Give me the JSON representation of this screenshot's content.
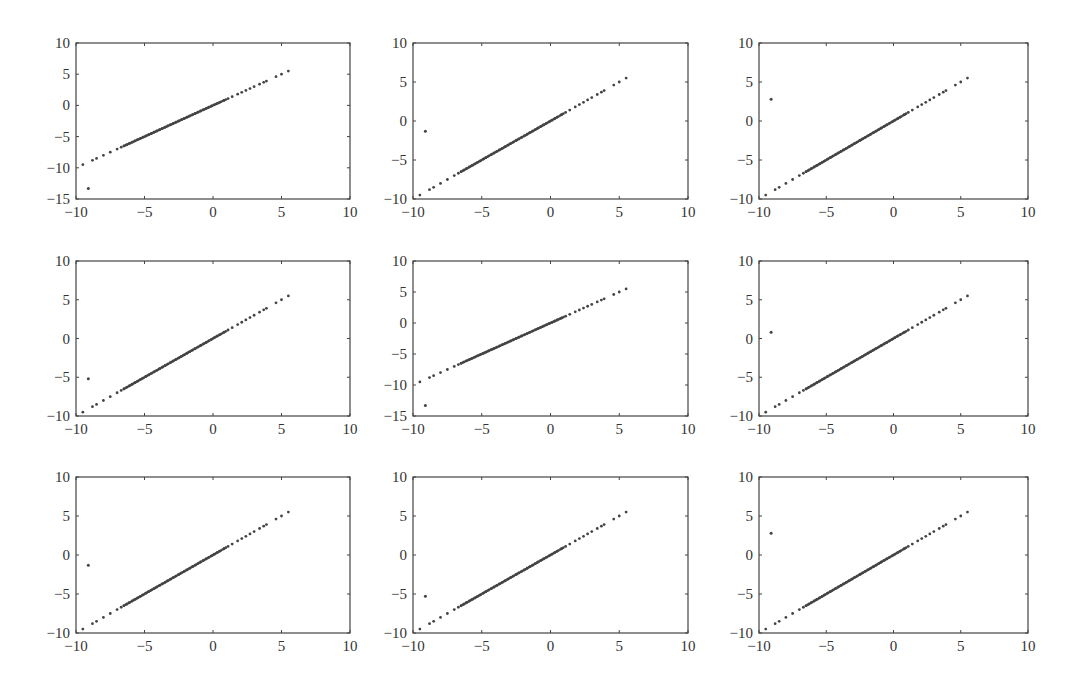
{
  "chart_data": {
    "type": "scatter",
    "layout": {
      "rows": 3,
      "cols": 3,
      "grid": false,
      "legend": null
    },
    "colors": {
      "points": "#444444",
      "axes": "#444444",
      "text": "#333333",
      "background": "#ffffff"
    },
    "line_model": {
      "description": "Points lie on y = x, dense for x in [-6.5, 1], sparse at the tails from -9.5 to 5.5",
      "x": [
        -9.5,
        -8.8,
        -8.5,
        -8.0,
        -7.5,
        -7.0,
        -6.7,
        -6.5,
        -6.3,
        -6.1,
        -5.9,
        -5.7,
        -5.5,
        -5.3,
        -5.1,
        -4.9,
        -4.7,
        -4.5,
        -4.3,
        -4.1,
        -3.9,
        -3.7,
        -3.5,
        -3.3,
        -3.1,
        -2.9,
        -2.7,
        -2.5,
        -2.3,
        -2.1,
        -1.9,
        -1.7,
        -1.5,
        -1.3,
        -1.1,
        -0.9,
        -0.7,
        -0.5,
        -0.3,
        -0.1,
        0.1,
        0.3,
        0.5,
        0.8,
        1.1,
        1.4,
        1.8,
        2.1,
        2.4,
        2.7,
        3.0,
        3.4,
        3.7,
        3.9,
        4.6,
        5.0,
        5.5
      ]
    },
    "subplots": [
      {
        "id": 1,
        "row": 1,
        "col": 1,
        "xlim": [
          -10,
          10
        ],
        "ylim": [
          -15,
          10
        ],
        "xticks": [
          "-10",
          "-5",
          "0",
          "5",
          "10"
        ],
        "yticks": [
          "10",
          "5",
          "0",
          "-5",
          "-10",
          "-15"
        ],
        "outlier": {
          "x": -9.1,
          "y": -13.3
        }
      },
      {
        "id": 2,
        "row": 1,
        "col": 2,
        "xlim": [
          -10,
          10
        ],
        "ylim": [
          -10,
          10
        ],
        "xticks": [
          "-10",
          "-5",
          "0",
          "5",
          "10"
        ],
        "yticks": [
          "10",
          "5",
          "0",
          "-5",
          "-10"
        ],
        "outlier": {
          "x": -9.1,
          "y": -1.3
        }
      },
      {
        "id": 3,
        "row": 1,
        "col": 3,
        "xlim": [
          -10,
          10
        ],
        "ylim": [
          -10,
          10
        ],
        "xticks": [
          "-10",
          "-5",
          "0",
          "5",
          "10"
        ],
        "yticks": [
          "10",
          "5",
          "0",
          "-5",
          "-10"
        ],
        "outlier": {
          "x": -9.1,
          "y": 2.8
        }
      },
      {
        "id": 4,
        "row": 2,
        "col": 1,
        "xlim": [
          -10,
          10
        ],
        "ylim": [
          -10,
          10
        ],
        "xticks": [
          "-10",
          "-5",
          "0",
          "5",
          "10"
        ],
        "yticks": [
          "10",
          "5",
          "0",
          "-5",
          "-10"
        ],
        "outlier": {
          "x": -9.1,
          "y": -5.2
        }
      },
      {
        "id": 5,
        "row": 2,
        "col": 2,
        "xlim": [
          -10,
          10
        ],
        "ylim": [
          -15,
          10
        ],
        "xticks": [
          "-10",
          "-5",
          "0",
          "5",
          "10"
        ],
        "yticks": [
          "10",
          "5",
          "0",
          "-5",
          "-10",
          "-15"
        ],
        "outlier": {
          "x": -9.1,
          "y": -13.3
        }
      },
      {
        "id": 6,
        "row": 2,
        "col": 3,
        "xlim": [
          -10,
          10
        ],
        "ylim": [
          -10,
          10
        ],
        "xticks": [
          "-10",
          "-5",
          "0",
          "5",
          "10"
        ],
        "yticks": [
          "10",
          "5",
          "0",
          "-5",
          "-10"
        ],
        "outlier": {
          "x": -9.1,
          "y": 0.8
        }
      },
      {
        "id": 7,
        "row": 3,
        "col": 1,
        "xlim": [
          -10,
          10
        ],
        "ylim": [
          -10,
          10
        ],
        "xticks": [
          "-10",
          "-5",
          "0",
          "5",
          "10"
        ],
        "yticks": [
          "10",
          "5",
          "0",
          "-5",
          "-10"
        ],
        "outlier": {
          "x": -9.1,
          "y": -1.3
        }
      },
      {
        "id": 8,
        "row": 3,
        "col": 2,
        "xlim": [
          -10,
          10
        ],
        "ylim": [
          -10,
          10
        ],
        "xticks": [
          "-10",
          "-5",
          "0",
          "5",
          "10"
        ],
        "yticks": [
          "10",
          "5",
          "0",
          "-5",
          "-10"
        ],
        "outlier": {
          "x": -9.1,
          "y": -5.3
        }
      },
      {
        "id": 9,
        "row": 3,
        "col": 3,
        "xlim": [
          -10,
          10
        ],
        "ylim": [
          -10,
          10
        ],
        "xticks": [
          "-10",
          "-5",
          "0",
          "5",
          "10"
        ],
        "yticks": [
          "10",
          "5",
          "0",
          "-5",
          "-10"
        ],
        "outlier": {
          "x": -9.1,
          "y": 2.8
        }
      }
    ],
    "title": "",
    "xlabel": "",
    "ylabel": ""
  }
}
